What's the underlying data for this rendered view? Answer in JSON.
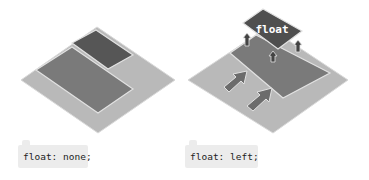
{
  "diagrams": [
    {
      "id": "float-none",
      "label": "float: none;",
      "colors": {
        "base": "#b9b9b9",
        "top_block": "#565656",
        "main_block": "#7a7a7a",
        "outline": "#e2e2e2"
      }
    },
    {
      "id": "float-left",
      "label": "float: left;",
      "floated_tile_text": "float",
      "colors": {
        "base": "#b9b9b9",
        "floated_block": "#4f4f4f",
        "main_block": "#7a7a7a",
        "arrow": "#6c6c6c",
        "outline": "#e2e2e2",
        "tile_text": "#ffffff"
      }
    }
  ],
  "label_background": "#ececec"
}
